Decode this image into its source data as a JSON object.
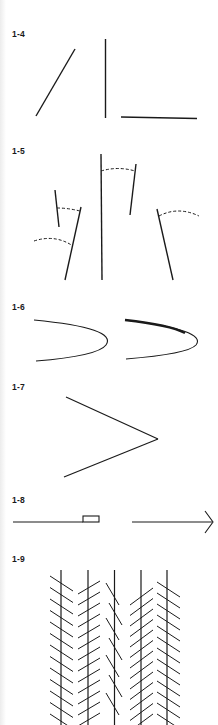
{
  "page": {
    "background": "#ffffff",
    "ink": "#1a1a1a"
  },
  "figures": [
    {
      "id": "1-4",
      "label": "1-4",
      "description": "Three line segments at differing orientations: oblique, vertical, horizontal"
    },
    {
      "id": "1-5",
      "label": "1-5",
      "description": "Line segments with dashed arcs indicating angular deviation from vertical"
    },
    {
      "id": "1-6",
      "label": "1-6",
      "description": "Two curved V shapes; the right one has a thickened upper stroke"
    },
    {
      "id": "1-7",
      "label": "1-7",
      "description": "Chevron / angle pointing right"
    },
    {
      "id": "1-8",
      "label": "1-8",
      "description": "Line with small rectangle, followed by a line ending in an arrowhead"
    },
    {
      "id": "1-9",
      "label": "1-9",
      "description": "Zöllner illusion: parallel vertical lines crossed by oblique hatch marks"
    }
  ]
}
